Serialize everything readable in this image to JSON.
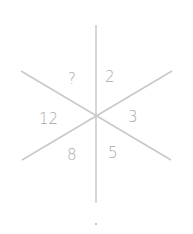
{
  "puzzle": {
    "type": "hexagonal-sector-number-puzzle",
    "sectors": [
      {
        "position": "top-left",
        "value": "?"
      },
      {
        "position": "top-right",
        "value": "2"
      },
      {
        "position": "right",
        "value": "3"
      },
      {
        "position": "bottom-right",
        "value": "5"
      },
      {
        "position": "bottom-left",
        "value": "8"
      },
      {
        "position": "left",
        "value": "12"
      }
    ],
    "line_color": "#c8c8c8",
    "text_color": "#a8a8a8"
  }
}
